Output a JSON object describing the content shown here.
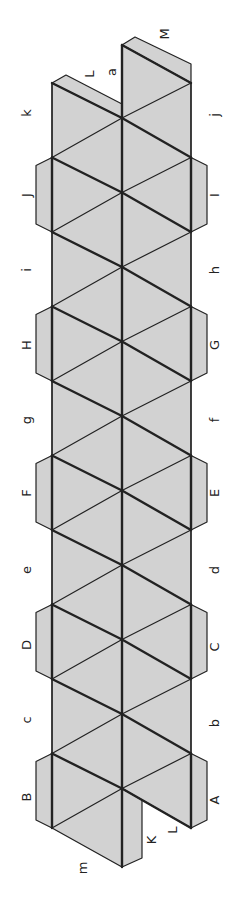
{
  "diagram": {
    "colors": {
      "fill": "#d2d2d2",
      "stroke": "#222222",
      "background": "#ffffff"
    },
    "geometry": {
      "left_x": 52,
      "center_x": 122,
      "right_x": 191,
      "side_y0": 83,
      "step": 74.5,
      "center_y0": 118,
      "center_top_y": 45,
      "center_bottom_y": 867
    },
    "labels": {
      "left": [
        {
          "text": "k",
          "x": 27,
          "y": 113
        },
        {
          "text": "J",
          "x": 27,
          "y": 195
        },
        {
          "text": "i",
          "x": 27,
          "y": 270
        },
        {
          "text": "H",
          "x": 27,
          "y": 345
        },
        {
          "text": "g",
          "x": 27,
          "y": 420
        },
        {
          "text": "F",
          "x": 27,
          "y": 493
        },
        {
          "text": "e",
          "x": 27,
          "y": 570
        },
        {
          "text": "D",
          "x": 27,
          "y": 645
        },
        {
          "text": "c",
          "x": 27,
          "y": 720
        },
        {
          "text": "B",
          "x": 27,
          "y": 797
        }
      ],
      "right": [
        {
          "text": "j",
          "x": 215,
          "y": 115
        },
        {
          "text": "I",
          "x": 215,
          "y": 195
        },
        {
          "text": "h",
          "x": 215,
          "y": 270
        },
        {
          "text": "G",
          "x": 215,
          "y": 345
        },
        {
          "text": "f",
          "x": 215,
          "y": 420
        },
        {
          "text": "E",
          "x": 215,
          "y": 493
        },
        {
          "text": "d",
          "x": 215,
          "y": 570
        },
        {
          "text": "C",
          "x": 215,
          "y": 647
        },
        {
          "text": "b",
          "x": 215,
          "y": 723
        },
        {
          "text": "A",
          "x": 215,
          "y": 800
        }
      ],
      "top": [
        {
          "text": "L",
          "x": 90,
          "y": 74
        },
        {
          "text": "a",
          "x": 112,
          "y": 72
        },
        {
          "text": "M",
          "x": 165,
          "y": 34
        }
      ],
      "bottom": [
        {
          "text": "m",
          "x": 83,
          "y": 868
        },
        {
          "text": "K",
          "x": 152,
          "y": 840
        },
        {
          "text": "L",
          "x": 173,
          "y": 830
        }
      ]
    }
  }
}
